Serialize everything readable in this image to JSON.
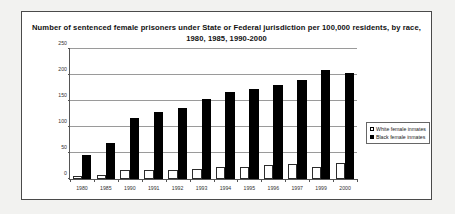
{
  "chart_data": {
    "type": "bar",
    "title": "Number of sentenced female prisoners under State or Federal jurisdiction per 100,000 residents, by race, 1980, 1985, 1990-2000",
    "xlabel": "",
    "ylabel": "",
    "ylim": [
      0,
      250
    ],
    "yticks": [
      0,
      50,
      100,
      150,
      200,
      250
    ],
    "grid": true,
    "legend_position": "right",
    "categories": [
      "1980",
      "1985",
      "1990",
      "1991",
      "1992",
      "1993",
      "1994",
      "1995",
      "1996",
      "1997",
      "1999",
      "2000"
    ],
    "series": [
      {
        "name": "White female inmates",
        "color": "#ffffff",
        "values": [
          6,
          8,
          17,
          17,
          18,
          20,
          24,
          24,
          27,
          29,
          24,
          31
        ]
      },
      {
        "name": "Black female inmates",
        "color": "#000000",
        "values": [
          47,
          70,
          117,
          128,
          136,
          153,
          167,
          174,
          181,
          190,
          210,
          203
        ]
      }
    ]
  },
  "legend": {
    "items": [
      {
        "label": "White female inmates"
      },
      {
        "label": "Black female inmates"
      }
    ]
  }
}
